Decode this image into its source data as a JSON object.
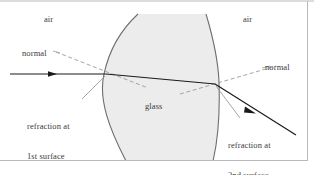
{
  "figure": {
    "background_color": "#ffffff",
    "frame_color": "#b9b9b9",
    "glass_fill_color": "#ececec",
    "glass_edge_color": "#6e6e6e",
    "ray_color": "#1a1a1a",
    "normal_color": "#9a9a9a",
    "leader_color": "#8f8f8f",
    "label_color": "#3a3a3a"
  },
  "labels": {
    "air_left": "air",
    "air_right": "air",
    "glass": "glass",
    "normal_left": "normal",
    "normal_right": "normal",
    "refraction_first_line1": "refraction at",
    "refraction_first_line2": "1st surface",
    "refraction_second_line1": "refraction at",
    "refraction_second_line2": "2nd surface"
  },
  "geometry": {
    "first_surface_point": [
      106,
      74
    ],
    "second_surface_point": [
      215,
      84
    ],
    "incident_ray_start": [
      10,
      74
    ],
    "exit_ray_end": [
      296,
      135
    ],
    "arrow_incident": [
      52,
      74
    ],
    "arrow_exit": [
      252,
      111
    ]
  }
}
